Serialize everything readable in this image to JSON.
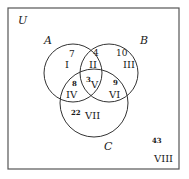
{
  "diagram": {
    "universe_label": "U",
    "sets": [
      {
        "name": "A",
        "label": "A"
      },
      {
        "name": "B",
        "label": "B"
      },
      {
        "name": "C",
        "label": "C"
      }
    ],
    "regions": [
      {
        "id": "I",
        "roman": "I",
        "count": "7"
      },
      {
        "id": "II",
        "roman": "II",
        "count": "4"
      },
      {
        "id": "III",
        "roman": "III",
        "count": "10"
      },
      {
        "id": "IV",
        "roman": "IV",
        "count": "8"
      },
      {
        "id": "V",
        "roman": "V",
        "count": "3"
      },
      {
        "id": "VI",
        "roman": "VI",
        "count": "9"
      },
      {
        "id": "VII",
        "roman": "VII",
        "count": "22"
      },
      {
        "id": "VIII",
        "roman": "VIII",
        "count": "43"
      }
    ],
    "colors": {
      "stroke": "#333333",
      "background": "#ffffff"
    }
  }
}
